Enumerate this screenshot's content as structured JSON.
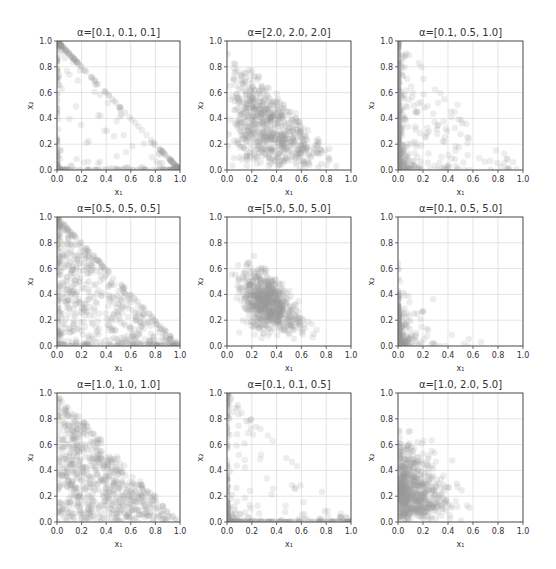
{
  "figure": {
    "width": 556,
    "height": 569,
    "background": "#ffffff",
    "point_color": "#999999",
    "grid_color": "#d8d8d8",
    "spine_color": "#444444"
  },
  "layout": {
    "columns_x": [
      [
        57,
        180
      ],
      [
        227,
        351
      ],
      [
        398,
        523
      ]
    ],
    "rows_y": [
      [
        41,
        170
      ],
      [
        217,
        346
      ],
      [
        393,
        522
      ]
    ]
  },
  "chart_data": [
    {
      "type": "scatter",
      "title": "α=[0.1, 0.1, 0.1]",
      "alpha": [
        0.1,
        0.1,
        0.1
      ],
      "xlabel": "x₁",
      "ylabel": "x₂",
      "xlim": [
        0,
        1
      ],
      "ylim": [
        0,
        1
      ],
      "xticks": [
        "0.0",
        "0.2",
        "0.4",
        "0.6",
        "0.8",
        "1.0"
      ],
      "yticks": [
        "0.0",
        "0.2",
        "0.4",
        "0.6",
        "0.8",
        "1.0"
      ],
      "grid": true,
      "description": "points concentrated at corners and along edges of simplex (x1+x2=1 diagonal, axes)"
    },
    {
      "type": "scatter",
      "title": "α=[2.0, 2.0, 2.0]",
      "alpha": [
        2.0,
        2.0,
        2.0
      ],
      "xlabel": "x₁",
      "ylabel": "x₂",
      "xlim": [
        0,
        1
      ],
      "ylim": [
        0,
        1
      ],
      "xticks": [
        "0.0",
        "0.2",
        "0.4",
        "0.6",
        "0.8",
        "1.0"
      ],
      "yticks": [
        "0.0",
        "0.2",
        "0.4",
        "0.6",
        "0.8",
        "1.0"
      ],
      "grid": true,
      "description": "points clustered around center (~0.33, 0.33), spread up to ~0.8"
    },
    {
      "type": "scatter",
      "title": "α=[0.1, 0.5, 1.0]",
      "alpha": [
        0.1,
        0.5,
        1.0
      ],
      "xlabel": "x₁",
      "ylabel": "x₂",
      "xlim": [
        0,
        1
      ],
      "ylim": [
        0,
        1
      ],
      "xticks": [
        "0.0",
        "0.2",
        "0.4",
        "0.6",
        "0.8",
        "1.0"
      ],
      "yticks": [
        "0.0",
        "0.2",
        "0.4",
        "0.6",
        "0.8",
        "1.0"
      ],
      "grid": true,
      "description": "points concentrated along x1≈0 edge"
    },
    {
      "type": "scatter",
      "title": "α=[0.5, 0.5, 0.5]",
      "alpha": [
        0.5,
        0.5,
        0.5
      ],
      "xlabel": "x₁",
      "ylabel": "x₂",
      "xlim": [
        0,
        1
      ],
      "ylim": [
        0,
        1
      ],
      "xticks": [
        "0.0",
        "0.2",
        "0.4",
        "0.6",
        "0.8",
        "1.0"
      ],
      "yticks": [
        "0.0",
        "0.2",
        "0.4",
        "0.6",
        "0.8",
        "1.0"
      ],
      "grid": true,
      "description": "points fill triangle x1+x2<=1, denser near edges"
    },
    {
      "type": "scatter",
      "title": "α=[5.0, 5.0, 5.0]",
      "alpha": [
        5.0,
        5.0,
        5.0
      ],
      "xlabel": "x₁",
      "ylabel": "x₂",
      "xlim": [
        0,
        1
      ],
      "ylim": [
        0,
        1
      ],
      "xticks": [
        "0.0",
        "0.2",
        "0.4",
        "0.6",
        "0.8",
        "1.0"
      ],
      "yticks": [
        "0.0",
        "0.2",
        "0.4",
        "0.6",
        "0.8",
        "1.0"
      ],
      "grid": true,
      "description": "tight cluster around (0.33, 0.33), range ~0.1-0.65"
    },
    {
      "type": "scatter",
      "title": "α=[0.1, 0.5, 5.0]",
      "alpha": [
        0.1,
        0.5,
        5.0
      ],
      "xlabel": "x₁",
      "ylabel": "x₂",
      "xlim": [
        0,
        1
      ],
      "ylim": [
        0,
        1
      ],
      "xticks": [
        "0.0",
        "0.2",
        "0.4",
        "0.6",
        "0.8",
        "1.0"
      ],
      "yticks": [
        "0.0",
        "0.2",
        "0.4",
        "0.6",
        "0.8",
        "1.0"
      ],
      "grid": true,
      "description": "points concentrated near origin, x1<0.2, x2<0.5"
    },
    {
      "type": "scatter",
      "title": "α=[1.0, 1.0, 1.0]",
      "alpha": [
        1.0,
        1.0,
        1.0
      ],
      "xlabel": "x₁",
      "ylabel": "x₂",
      "xlim": [
        0,
        1
      ],
      "ylim": [
        0,
        1
      ],
      "xticks": [
        "0.0",
        "0.2",
        "0.4",
        "0.6",
        "0.8",
        "1.0"
      ],
      "yticks": [
        "0.0",
        "0.2",
        "0.4",
        "0.6",
        "0.8",
        "1.0"
      ],
      "grid": true,
      "description": "uniform fill of triangle x1+x2<=1"
    },
    {
      "type": "scatter",
      "title": "α=[0.1, 0.1, 0.5]",
      "alpha": [
        0.1,
        0.1,
        0.5
      ],
      "xlabel": "x₁",
      "ylabel": "x₂",
      "xlim": [
        0,
        1
      ],
      "ylim": [
        0,
        1
      ],
      "xticks": [
        "0.0",
        "0.2",
        "0.4",
        "0.6",
        "0.8",
        "1.0"
      ],
      "yticks": [
        "0.0",
        "0.2",
        "0.4",
        "0.6",
        "0.8",
        "1.0"
      ],
      "grid": true,
      "description": "points along x1=0 and x2=0 edges, concentrated at origin"
    },
    {
      "type": "scatter",
      "title": "α=[1.0, 2.0, 5.0]",
      "alpha": [
        1.0,
        2.0,
        5.0
      ],
      "xlabel": "x₁",
      "ylabel": "x₂",
      "xlim": [
        0,
        1
      ],
      "ylim": [
        0,
        1
      ],
      "xticks": [
        "0.0",
        "0.2",
        "0.4",
        "0.6",
        "0.8",
        "1.0"
      ],
      "yticks": [
        "0.0",
        "0.2",
        "0.4",
        "0.6",
        "0.8",
        "1.0"
      ],
      "grid": true,
      "description": "points near lower-left, x1<0.6, x2<0.7"
    }
  ],
  "sampling": {
    "points_per_panel": 700,
    "marker_radius": 3.2,
    "marker_opacity": 0.18,
    "seed": 12345
  }
}
